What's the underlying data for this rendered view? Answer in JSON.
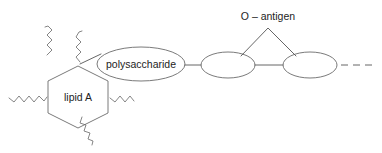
{
  "diagram": {
    "background_color": "#ffffff",
    "line_color": "#555555",
    "shape_stroke_color": "#6b6b6b",
    "text_color": "#1d1d1d",
    "labels": {
      "lipid_a": "lipid A",
      "polysaccharide": "polysaccharide",
      "o_antigen": "O – antigen"
    },
    "shapes": {
      "hexagon": {
        "name": "lipid A",
        "center_x": 78,
        "center_y": 97,
        "width": 62,
        "height": 60
      },
      "ellipse_polysaccharide": {
        "name": "polysaccharide",
        "cx": 141,
        "cy": 64,
        "rx": 44,
        "ry": 17
      },
      "ellipse_core_1": {
        "name": "core sugar unit 1",
        "cx": 228,
        "cy": 65,
        "rx": 27,
        "ry": 13
      },
      "ellipse_core_2": {
        "name": "core sugar unit 2",
        "cx": 310,
        "cy": 65,
        "rx": 27,
        "ry": 13
      },
      "triangle_o_antigen": {
        "name": "O antigen repeat unit",
        "apex_x": 268,
        "apex_y": 28,
        "left_x": 241,
        "left_y": 56,
        "right_x": 296,
        "right_y": 56
      }
    },
    "fatty_acid_chains": [
      {
        "name": "chain-left-horizontal",
        "orientation": "horizontal",
        "side": "left"
      },
      {
        "name": "chain-upper-left-vertical",
        "orientation": "vertical",
        "side": "top-left"
      },
      {
        "name": "chain-top-vertical",
        "orientation": "vertical",
        "side": "top-center"
      },
      {
        "name": "chain-right-horizontal",
        "orientation": "horizontal",
        "side": "right"
      },
      {
        "name": "chain-lower-right-diagonal",
        "orientation": "diagonal",
        "side": "bottom-right"
      }
    ],
    "continuation": {
      "name": "dashed-continuation",
      "dash_count": 3
    }
  }
}
